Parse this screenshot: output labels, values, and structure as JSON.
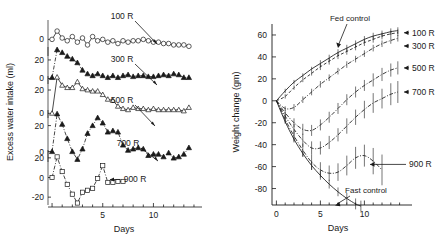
{
  "figure": {
    "panels": [
      "left-water-intake",
      "right-weight-change"
    ]
  },
  "left_panel": {
    "ylabel": "Excess water intake (ml)",
    "xlabel": "Days",
    "x_ticks": [
      {
        "v": 0,
        "label": ""
      },
      {
        "v": 5,
        "label": "5"
      },
      {
        "v": 10,
        "label": "10"
      }
    ],
    "x_minor_step": 1,
    "xlim": [
      -0.4,
      14.2
    ],
    "series_labels": [
      "100 R",
      "300 R",
      "500 R",
      "700 R",
      "900 R"
    ],
    "subplot_yticks": [
      [
        "0"
      ],
      [
        "20",
        "0"
      ],
      [
        "20",
        "0"
      ],
      [
        "20",
        "0"
      ],
      [
        "20",
        "0",
        "-20"
      ]
    ]
  },
  "right_panel": {
    "ylabel": "Weight change (gm)",
    "xlabel": "Days",
    "y_ticks": [
      "60",
      "40",
      "20",
      "0",
      "-20",
      "-40",
      "-60",
      "-80"
    ],
    "x_ticks": [
      {
        "v": 0,
        "label": "0"
      },
      {
        "v": 5,
        "label": "5"
      },
      {
        "v": 10,
        "label": "10"
      }
    ],
    "annotations": [
      {
        "name": "fed-control",
        "text": "Fed control"
      },
      {
        "name": "fast-control",
        "text": "Fast control"
      }
    ],
    "series_labels": [
      "100 R",
      "300 R",
      "500 R",
      "700 R",
      "900 R"
    ]
  },
  "chart_data": [
    {
      "type": "line",
      "name": "excess-water-intake",
      "title": "",
      "xlabel": "Days",
      "ylabel": "Excess water intake (ml)",
      "xlim": [
        -0.4,
        14.2
      ],
      "grid": false,
      "legend": "inline-annotations",
      "series": [
        {
          "name": "100 R",
          "marker": "open-circle",
          "line": "solid",
          "ylim": [
            -12,
            14
          ],
          "x": [
            0,
            0.5,
            1,
            1.5,
            2,
            2.5,
            3,
            3.5,
            4,
            4.5,
            5,
            5.5,
            6,
            6.5,
            7,
            7.5,
            8,
            8.5,
            9,
            9.5,
            10,
            10.5,
            11,
            11.5,
            12,
            12.5,
            13,
            13.5
          ],
          "y": [
            0,
            6,
            1,
            -1,
            2,
            -2,
            1,
            -4,
            2,
            -1,
            0,
            -2,
            -1,
            -3,
            -1,
            -2,
            -1,
            -1,
            0,
            -1,
            -2,
            -2,
            -3,
            -3,
            -4,
            -4,
            -4,
            -5
          ]
        },
        {
          "name": "300 R",
          "marker": "filled-triangle",
          "line": "dash-dot",
          "ylim": [
            -6,
            34
          ],
          "x": [
            0,
            0.5,
            1,
            1.5,
            2,
            2.5,
            3,
            3.5,
            4,
            4.5,
            5,
            5.5,
            6,
            6.5,
            7,
            7.5,
            8,
            8.5,
            9,
            9.5,
            10,
            10.5,
            11,
            11.5,
            12,
            12.5,
            13,
            13.5
          ],
          "y": [
            1,
            31,
            28,
            24,
            21,
            17,
            9,
            5,
            3,
            5,
            3,
            1,
            3,
            1,
            3,
            4,
            2,
            3,
            3,
            2,
            2,
            3,
            4,
            3,
            5,
            4,
            1,
            1
          ]
        },
        {
          "name": "500 R",
          "marker": "open-triangle",
          "line": "solid",
          "ylim": [
            -4,
            32
          ],
          "x": [
            0,
            0.5,
            1,
            1.5,
            2,
            2.5,
            3,
            3.5,
            4,
            4.5,
            5,
            5.5,
            6,
            6.5,
            7,
            7.5,
            8,
            8.5,
            9,
            9.5,
            10,
            10.5,
            11,
            11.5,
            12,
            12.5,
            13,
            13.5
          ],
          "y": [
            0,
            31,
            24,
            22,
            22,
            27,
            21,
            20,
            19,
            19,
            16,
            12,
            11,
            6,
            4,
            3,
            5,
            4,
            4,
            3,
            4,
            3,
            3,
            3,
            3,
            3,
            2,
            5
          ]
        },
        {
          "name": "700 R",
          "marker": "filled-triangle",
          "line": "dash-dot",
          "ylim": [
            -8,
            32
          ],
          "x": [
            0,
            0.5,
            1,
            1.5,
            2,
            2.5,
            3,
            3.5,
            4,
            4.5,
            5,
            5.5,
            6,
            6.5,
            7,
            7.5,
            8,
            8.5,
            9,
            9.5,
            10,
            10.5,
            11,
            11.5,
            12,
            12.5,
            13,
            13.5
          ],
          "y": [
            0,
            29,
            21,
            10,
            0,
            -6,
            2,
            14,
            20,
            26,
            22,
            15,
            16,
            15,
            5,
            1,
            2,
            3,
            2,
            -3,
            -2,
            -2,
            -4,
            -1,
            -5,
            -4,
            -2,
            3
          ]
        },
        {
          "name": "900 R",
          "marker": "open-square",
          "line": "dash-dot",
          "ylim": [
            -28,
            28
          ],
          "x": [
            0,
            0.5,
            1,
            1.5,
            2,
            2.5,
            3,
            3.5,
            4,
            4.5,
            5,
            5.5,
            6,
            6.5,
            7
          ],
          "y": [
            0,
            21,
            6,
            -7,
            -17,
            -26,
            -15,
            -13,
            -11,
            -1,
            12,
            -5,
            -5,
            -4,
            -4
          ]
        }
      ]
    },
    {
      "type": "line",
      "name": "weight-change",
      "title": "",
      "xlabel": "Days",
      "ylabel": "Weight change (gm)",
      "xlim": [
        -0.5,
        14.5
      ],
      "ylim": [
        -95,
        70
      ],
      "grid": false,
      "errorbars": true,
      "legend": "right-side-arrows",
      "series": [
        {
          "name": "Fed control",
          "line": "solid",
          "x": [
            0,
            1,
            2,
            3,
            4,
            5,
            6,
            7,
            8,
            9,
            10,
            11,
            12,
            13,
            13.8
          ],
          "y": [
            0,
            9,
            17,
            23,
            29,
            34,
            39,
            44,
            48,
            52,
            56,
            59,
            61,
            63,
            64
          ],
          "err": [
            0,
            2,
            2,
            2,
            2,
            3,
            3,
            3,
            3,
            3,
            3,
            3,
            3,
            3,
            3
          ]
        },
        {
          "name": "100 R",
          "line": "dashed",
          "x": [
            0,
            1,
            2,
            3,
            4,
            5,
            6,
            7,
            8,
            9,
            10,
            11,
            12,
            13,
            13.8
          ],
          "y": [
            0,
            4,
            12,
            19,
            25,
            31,
            36,
            41,
            45,
            49,
            53,
            56,
            59,
            61,
            62
          ],
          "err": [
            0,
            2,
            2,
            2,
            2,
            3,
            3,
            3,
            3,
            3,
            3,
            3,
            3,
            3,
            3
          ]
        },
        {
          "name": "300 R",
          "line": "dash-dot",
          "x": [
            0,
            1,
            2,
            3,
            4,
            5,
            6,
            7,
            8,
            9,
            10,
            11,
            12,
            13,
            13.8
          ],
          "y": [
            0,
            -7,
            -6,
            1,
            8,
            15,
            21,
            27,
            33,
            38,
            43,
            48,
            52,
            55,
            57
          ],
          "err": [
            0,
            2,
            3,
            3,
            3,
            3,
            3,
            3,
            3,
            3,
            3,
            3,
            3,
            3,
            3
          ]
        },
        {
          "name": "500 R",
          "line": "dash-dot",
          "x": [
            0,
            1,
            2,
            3,
            4,
            5,
            6,
            7,
            8,
            9,
            10,
            11,
            12,
            13,
            13.8
          ],
          "y": [
            0,
            -11,
            -20,
            -26,
            -27,
            -22,
            -15,
            -7,
            1,
            8,
            14,
            19,
            24,
            28,
            30
          ],
          "err": [
            0,
            3,
            4,
            5,
            5,
            5,
            5,
            5,
            5,
            5,
            5,
            6,
            6,
            6,
            6
          ]
        },
        {
          "name": "700 R",
          "line": "dash-dot",
          "x": [
            0,
            1,
            2,
            3,
            4,
            5,
            6,
            7,
            8,
            9,
            10,
            11,
            12,
            13,
            13.8
          ],
          "y": [
            0,
            -14,
            -26,
            -36,
            -43,
            -43,
            -38,
            -31,
            -23,
            -15,
            -8,
            -2,
            2,
            6,
            8
          ],
          "err": [
            0,
            3,
            5,
            6,
            6,
            6,
            6,
            6,
            7,
            7,
            8,
            9,
            9,
            10,
            10
          ]
        },
        {
          "name": "900 R",
          "line": "dash-dot",
          "x": [
            0,
            1,
            2,
            3,
            4,
            5,
            6,
            7,
            8,
            9,
            10,
            11,
            12
          ],
          "y": [
            0,
            -17,
            -32,
            -45,
            -56,
            -63,
            -66,
            -65,
            -59,
            -52,
            -50,
            -55,
            -63
          ],
          "err": [
            0,
            3,
            5,
            6,
            7,
            7,
            7,
            8,
            9,
            10,
            10,
            12,
            14
          ]
        },
        {
          "name": "Fast control",
          "line": "solid",
          "x": [
            0,
            1,
            2,
            3,
            4,
            5,
            6,
            7,
            8,
            9,
            9.6
          ],
          "y": [
            0,
            -19,
            -35,
            -48,
            -59,
            -68,
            -76,
            -83,
            -89,
            -94,
            -96
          ],
          "err": [
            0,
            2,
            3,
            3,
            4,
            4,
            4,
            4,
            5,
            5,
            5
          ]
        }
      ]
    }
  ]
}
